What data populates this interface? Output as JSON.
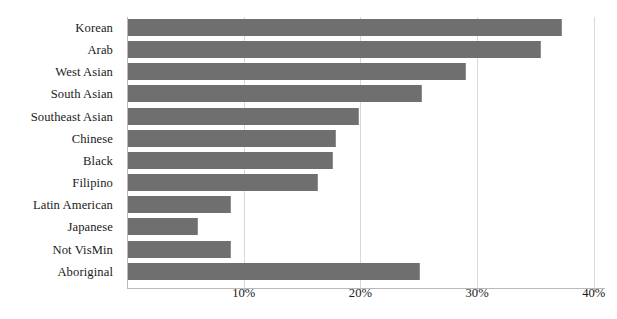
{
  "chart_data": {
    "type": "bar",
    "orientation": "horizontal",
    "title": "",
    "subtitle": "",
    "xlabel": "",
    "ylabel": "",
    "xlim": [
      0,
      41.8
    ],
    "grid": "vertical",
    "legend": "none",
    "bar_color": "#6f6f6f",
    "axis_color": "#b9b9b9",
    "gridline_color": "#d8d8d8",
    "text_color": "#1a1a1a",
    "xtick_labels": [
      "10%",
      "20%",
      "30%",
      "40%"
    ],
    "xtick_values": [
      10,
      20,
      30,
      40
    ],
    "categories": [
      "Korean",
      "Arab",
      "West Asian",
      "South Asian",
      "Southeast Asian",
      "Chinese",
      "Black",
      "Filipino",
      "Latin American",
      "Japanese",
      "Not VisMin",
      "Aboriginal"
    ],
    "values": [
      37.2,
      35.4,
      29.0,
      25.2,
      19.8,
      17.8,
      17.6,
      16.3,
      8.8,
      6.0,
      8.8,
      25.0
    ],
    "value_labels": [
      "37.2%",
      "35.4%",
      "29.0%",
      "25.2%",
      "19.8%",
      "17.8%",
      "17.6%",
      "16.3%",
      "8.8%",
      "6.0%",
      "8.8%",
      "25.0%"
    ]
  }
}
